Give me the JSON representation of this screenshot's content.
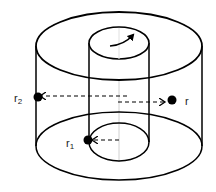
{
  "diagram": {
    "type": "coaxial-cylinders",
    "colors": {
      "stroke": "#000000",
      "axis": "#cccccc",
      "background": "#ffffff"
    },
    "rotation_arrow": "curved-arrow-clockwise-on-top-of-inner-cylinder",
    "labels": {
      "r2": {
        "base": "r",
        "sub": "2"
      },
      "r1": {
        "base": "r",
        "sub": "1"
      },
      "r": {
        "base": "r",
        "sub": ""
      }
    },
    "points": [
      {
        "name": "r2",
        "position": "on outer cylinder wall",
        "arrow": "from axis leftward"
      },
      {
        "name": "r1",
        "position": "on inner cylinder wall at base",
        "arrow": "from axis leftward"
      },
      {
        "name": "r",
        "position": "between cylinders",
        "arrow": "from axis rightward"
      }
    ]
  }
}
